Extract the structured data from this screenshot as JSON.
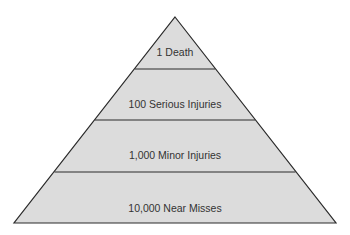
{
  "diagram": {
    "type": "pyramid",
    "colors": {
      "fill": "#dcdcdc",
      "stroke": "#2a2a2a",
      "text": "#333333",
      "background": "#ffffff"
    },
    "tiers": [
      {
        "label": "1 Death"
      },
      {
        "label": "100 Serious Injuries"
      },
      {
        "label": "1,000 Minor Injuries"
      },
      {
        "label": "10,000 Near Misses"
      }
    ]
  }
}
